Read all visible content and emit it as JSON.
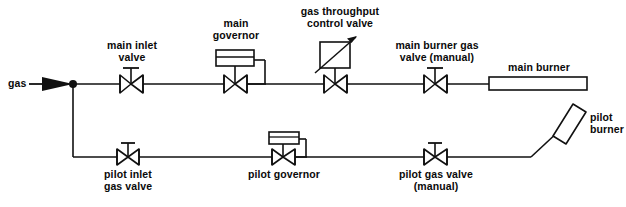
{
  "diagram": {
    "type": "process-flow-diagram",
    "stroke_color": "#111111",
    "background_color": "#ffffff",
    "labels": {
      "gas_inlet": "gas",
      "main_inlet_valve": "main inlet\nvalve",
      "main_governor": "main\ngovernor",
      "gas_throughput_control_valve": "gas throughput\ncontrol valve",
      "main_burner_gas_valve": "main burner gas\nvalve (manual)",
      "main_burner": "main burner",
      "pilot_burner": "pilot\nburner",
      "pilot_inlet_gas_valve": "pilot inlet\ngas valve",
      "pilot_governor": "pilot governor",
      "pilot_gas_valve": "pilot gas valve\n(manual)"
    },
    "components": [
      {
        "name": "gas-inlet-arrow",
        "kind": "flow-arrow",
        "label": "gas"
      },
      {
        "name": "branch-junction",
        "kind": "junction-dot"
      },
      {
        "name": "main-inlet-valve",
        "kind": "gate-valve",
        "line": "main"
      },
      {
        "name": "main-governor",
        "kind": "governor-valve",
        "line": "main"
      },
      {
        "name": "gas-throughput-control-valve",
        "kind": "control-valve",
        "line": "main"
      },
      {
        "name": "main-burner-gas-valve",
        "kind": "gate-valve",
        "line": "main"
      },
      {
        "name": "main-burner",
        "kind": "burner-rectangle",
        "line": "main"
      },
      {
        "name": "pilot-inlet-gas-valve",
        "kind": "gate-valve",
        "line": "pilot"
      },
      {
        "name": "pilot-governor",
        "kind": "governor-valve",
        "line": "pilot"
      },
      {
        "name": "pilot-gas-valve",
        "kind": "gate-valve",
        "line": "pilot"
      },
      {
        "name": "pilot-burner",
        "kind": "tilted-burner-rectangle",
        "line": "pilot"
      }
    ]
  }
}
